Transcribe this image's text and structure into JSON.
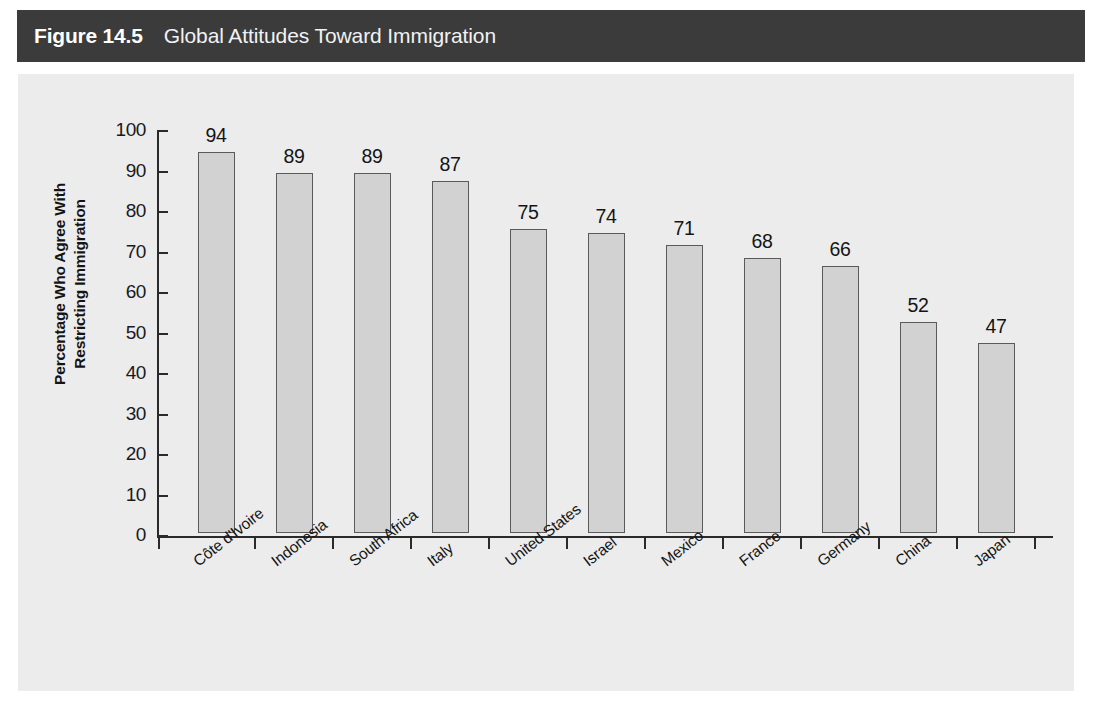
{
  "figure": {
    "number_label": "Figure 14.5",
    "title": "Global Attitudes Toward Immigration"
  },
  "chart_data": {
    "type": "bar",
    "title": "Global Attitudes Toward Immigration",
    "xlabel": "",
    "ylabel": "Percentage Who Agree With Restricting Immigration",
    "ylabel_line1": "Percentage Who Agree With",
    "ylabel_line2": "Restricting Immigration",
    "ylim": [
      0,
      100
    ],
    "ytick_step": 10,
    "yticks": [
      0,
      10,
      20,
      30,
      40,
      50,
      60,
      70,
      80,
      90,
      100
    ],
    "ytick_labels": [
      "0",
      "10",
      "20",
      "30",
      "40",
      "50",
      "60",
      "70",
      "80",
      "90",
      "100"
    ],
    "grid": false,
    "legend": null,
    "value_labels_shown": true,
    "categories": [
      "Côte d'Ivoire",
      "Indonesia",
      "South Africa",
      "Italy",
      "United States",
      "Israel",
      "Mexico",
      "France",
      "Germany",
      "China",
      "Japan"
    ],
    "values": [
      94,
      89,
      89,
      87,
      75,
      74,
      71,
      68,
      66,
      52,
      47
    ],
    "value_label_texts": [
      "94",
      "89",
      "89",
      "87",
      "75",
      "74",
      "71",
      "68",
      "66",
      "52",
      "47"
    ],
    "bar_fill_color": "#d2d2d2",
    "bar_border_color": "#5a5a5a",
    "plot_background_color": "#ececec",
    "axis_color": "#2a2a2a",
    "header_background_color": "#3b3b3b",
    "header_text_color": "#ffffff"
  }
}
